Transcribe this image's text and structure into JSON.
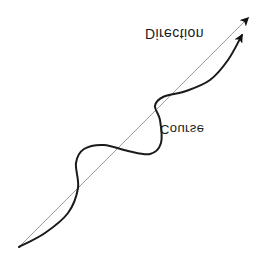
{
  "figure": {
    "background_color": "#ffffff",
    "width": 268,
    "height": 266
  },
  "labels": {
    "direction": "Direction",
    "course": "Course",
    "text_color": "#1a1a1a",
    "orientation": "vertically-mirrored"
  },
  "chart_data": {
    "type": "line",
    "xlabel": "",
    "ylabel": "",
    "grid": false,
    "legend_position": "inline-annotations",
    "annotations": [
      {
        "text": "Direction",
        "x": 145,
        "y": 26,
        "target": "straight-line"
      },
      {
        "text": "Course",
        "x": 160,
        "y": 122,
        "target": "wavy-curve"
      }
    ],
    "series": [
      {
        "name": "Direction",
        "style": "straight",
        "color": "#9a9a9a",
        "stroke_width": 1,
        "arrowhead": true,
        "points": [
          {
            "x": 19,
            "y": 247
          },
          {
            "x": 248,
            "y": 18
          }
        ]
      },
      {
        "name": "Course",
        "style": "wavy",
        "color": "#1a1a1a",
        "stroke_width": 2,
        "arrowhead": true,
        "points": [
          {
            "x": 19,
            "y": 247
          },
          {
            "x": 45,
            "y": 233
          },
          {
            "x": 68,
            "y": 213
          },
          {
            "x": 78,
            "y": 188
          },
          {
            "x": 76,
            "y": 163
          },
          {
            "x": 84,
            "y": 149
          },
          {
            "x": 104,
            "y": 145
          },
          {
            "x": 128,
            "y": 151
          },
          {
            "x": 150,
            "y": 154
          },
          {
            "x": 161,
            "y": 143
          },
          {
            "x": 160,
            "y": 120
          },
          {
            "x": 155,
            "y": 106
          },
          {
            "x": 163,
            "y": 97
          },
          {
            "x": 186,
            "y": 91
          },
          {
            "x": 210,
            "y": 80
          },
          {
            "x": 228,
            "y": 60
          },
          {
            "x": 242,
            "y": 35
          }
        ]
      }
    ]
  }
}
